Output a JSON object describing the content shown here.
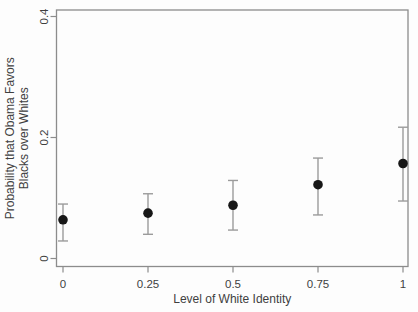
{
  "figure": {
    "background": "#fdfdfd",
    "box_color": "#8c8c8c",
    "tick_color": "#8c8c8c",
    "errorbar_color": "#9b9b9b",
    "point_color": "#171717",
    "text_color": "#3f3f3f"
  },
  "chart_data": {
    "type": "scatter",
    "title": "",
    "xlabel": "Level of White Identity",
    "ylabel_line1": "Probability that Obama Favors",
    "ylabel_line2": "Blacks over Whites",
    "x": [
      0,
      0.25,
      0.5,
      0.75,
      1
    ],
    "xtick_labels": [
      "0",
      "0.25",
      "0.5",
      "0.75",
      "1"
    ],
    "series": [
      {
        "name": "predicted-probability",
        "marker": "filled-circle",
        "values": [
          0.064,
          0.075,
          0.088,
          0.122,
          0.157
        ],
        "ci_lower": [
          0.029,
          0.04,
          0.047,
          0.072,
          0.095
        ],
        "ci_upper": [
          0.09,
          0.107,
          0.129,
          0.166,
          0.217
        ]
      }
    ],
    "yticks": [
      0,
      0.2,
      0.4
    ],
    "ytick_labels": [
      "0",
      "0.2",
      "0.4"
    ],
    "ylim": [
      -0.016,
      0.416
    ],
    "xlim": [
      -0.04,
      1.04
    ],
    "grid": false,
    "legend_position": "none",
    "error_bars": "vertical-with-caps",
    "plot_box": "full-frame"
  }
}
